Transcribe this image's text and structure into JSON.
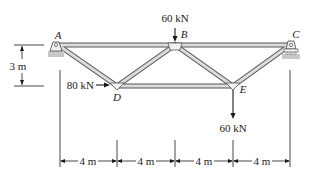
{
  "diagram": {
    "type": "truss",
    "joints": {
      "A": {
        "label": "A"
      },
      "B": {
        "label": "B"
      },
      "C": {
        "label": "C"
      },
      "D": {
        "label": "D"
      },
      "E": {
        "label": "E"
      }
    },
    "loads": {
      "B": {
        "value": "60 kN",
        "direction": "down"
      },
      "D": {
        "value": "80 kN",
        "direction": "right"
      },
      "E": {
        "value": "60 kN",
        "direction": "down"
      }
    },
    "dimensions": {
      "height": "3 m",
      "spans": [
        "4 m",
        "4 m",
        "4 m",
        "4 m"
      ]
    },
    "colors": {
      "member": "#d9d9d9",
      "member_edge": "#555555",
      "line": "#1a1a1a",
      "ground": "#bdbdbd"
    }
  }
}
